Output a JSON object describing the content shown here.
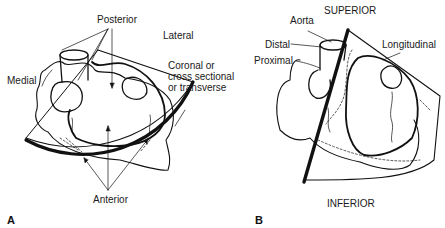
{
  "panels": [
    {
      "letter": "A",
      "plane": "Coronal or cross sectional or transverse",
      "labels": {
        "posterior": "Posterior",
        "lateral": "Lateral",
        "medial": "Medial",
        "plane": "Coronal or\ncross sectional\nor transverse",
        "anterior": "Anterior"
      }
    },
    {
      "letter": "B",
      "plane": "Longitudinal",
      "labels": {
        "superior": "SUPERIOR",
        "aorta": "Aorta",
        "distal": "Distal",
        "proximal": "Proximal",
        "longitudinal": "Longitudinal",
        "inferior": "INFERIOR"
      }
    }
  ],
  "colors": {
    "line": "#111111",
    "background": "#ffffff"
  }
}
